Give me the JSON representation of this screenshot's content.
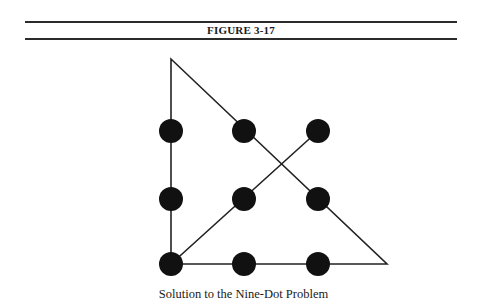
{
  "figure": {
    "label": "FIGURE 3-17",
    "caption": "Solution to the Nine-Dot Problem"
  },
  "diagram": {
    "type": "nine-dot-puzzle-solution",
    "dots": [
      {
        "row": 1,
        "col": 1,
        "x": 171,
        "y": 131
      },
      {
        "row": 1,
        "col": 2,
        "x": 244,
        "y": 131
      },
      {
        "row": 1,
        "col": 3,
        "x": 318,
        "y": 131
      },
      {
        "row": 2,
        "col": 1,
        "x": 171,
        "y": 199
      },
      {
        "row": 2,
        "col": 2,
        "x": 244,
        "y": 199
      },
      {
        "row": 2,
        "col": 3,
        "x": 318,
        "y": 199
      },
      {
        "row": 3,
        "col": 1,
        "x": 171,
        "y": 264
      },
      {
        "row": 3,
        "col": 2,
        "x": 244,
        "y": 264
      },
      {
        "row": 3,
        "col": 3,
        "x": 318,
        "y": 264
      }
    ],
    "path": [
      {
        "x": 318,
        "y": 131
      },
      {
        "x": 171,
        "y": 264
      },
      {
        "x": 171,
        "y": 59
      },
      {
        "x": 387,
        "y": 264
      },
      {
        "x": 171,
        "y": 264
      }
    ],
    "dot_radius": 12,
    "dot_color": "#111111",
    "line_color": "#222222"
  }
}
